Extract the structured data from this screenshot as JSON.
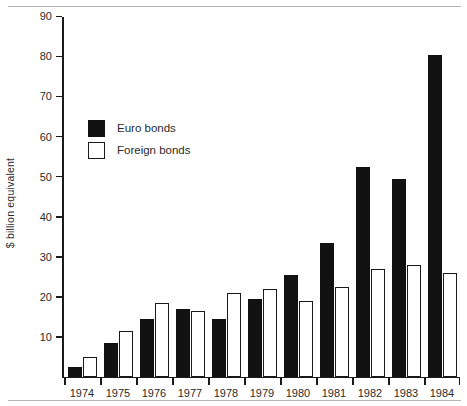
{
  "chart_data": {
    "type": "bar",
    "title": "",
    "subtitle": "",
    "xlabel": "",
    "ylabel": "$ billion equivalent",
    "categories": [
      "1974",
      "1975",
      "1976",
      "1977",
      "1978",
      "1979",
      "1980",
      "1981",
      "1982",
      "1983",
      "1984"
    ],
    "series": [
      {
        "name": "Euro bonds",
        "color": "#111111",
        "values": [
          2.5,
          8.5,
          14.5,
          17,
          14.5,
          19.5,
          25.5,
          33.5,
          52.5,
          49.5,
          80.5
        ]
      },
      {
        "name": "Foreign bonds",
        "color": "#ffffff",
        "values": [
          5,
          11.5,
          18.5,
          16.5,
          21,
          22,
          19,
          22.5,
          27,
          28,
          26
        ]
      }
    ],
    "ylim": [
      0,
      90
    ],
    "yticks": [
      10,
      20,
      30,
      40,
      50,
      60,
      70,
      80,
      90
    ],
    "ytick_labels": [
      "10",
      "20",
      "30",
      "40",
      "50",
      "60",
      "70",
      "80",
      "90"
    ],
    "grid": false,
    "legend_position": "upper-left-inside"
  },
  "legend": {
    "items": [
      {
        "label": "Euro bonds",
        "swatch": "filled-black-square"
      },
      {
        "label": "Foreign bonds",
        "swatch": "outlined-white-square"
      }
    ]
  },
  "axes": {
    "y_title": "$ billion equivalent"
  }
}
